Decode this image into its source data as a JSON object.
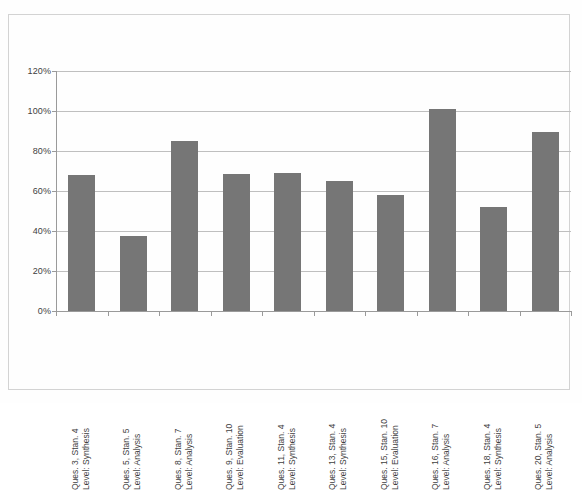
{
  "chart_data": {
    "type": "bar",
    "title": "",
    "subtitle": "",
    "xlabel": "",
    "ylabel": "",
    "ylim": [
      0,
      120
    ],
    "y_tick_labels": [
      "120%",
      "100%",
      "80%",
      "60%",
      "40%",
      "20%",
      "0%"
    ],
    "y_tick_values": [
      120,
      100,
      80,
      60,
      40,
      20,
      0
    ],
    "grid": true,
    "legend": "none",
    "bar_color": "#767676",
    "categories": [
      "Ques. 3, Stan. 4 Level: Synthesis",
      "Ques. 5, Stan. 5 Level: Analysis",
      "Ques. 8, Stan. 7 Level: Analysis",
      "Ques. 9, Stan. 10 Level: Evaluation",
      "Ques. 11, Stan. 4 Level: Synthesis",
      "Ques. 13, Stan. 4 Level: Synthesis",
      "Ques. 15, Stan. 10 Level: Evaluation",
      "Ques. 16, Stan. 7 Level: Analysis",
      "Ques. 18, Stan. 4 Level: Synthesis",
      "Ques. 20, Stan. 5 Level: Analysis"
    ],
    "category_lines": [
      {
        "line1": "Ques. 3, Stan. 4",
        "line2": "Level: Synthesis"
      },
      {
        "line1": "Ques. 5, Stan. 5",
        "line2": "Level: Analysis"
      },
      {
        "line1": "Ques. 8, Stan. 7",
        "line2": "Level: Analysis"
      },
      {
        "line1": "Ques. 9, Stan. 10",
        "line2": "Level: Evaluation"
      },
      {
        "line1": "Ques. 11, Stan. 4",
        "line2": "Level: Synthesis"
      },
      {
        "line1": "Ques. 13, Stan. 4",
        "line2": "Level: Synthesis"
      },
      {
        "line1": "Ques. 15, Stan. 10",
        "line2": "Level: Evaluation"
      },
      {
        "line1": "Ques. 16, Stan. 7",
        "line2": "Level: Analysis"
      },
      {
        "line1": "Ques. 18, Stan. 4",
        "line2": "Level: Synthesis"
      },
      {
        "line1": "Ques. 20, Stan. 5",
        "line2": "Level: Analysis"
      }
    ],
    "values": [
      68,
      37.5,
      85,
      68.5,
      69,
      65,
      58,
      101,
      52,
      89.5
    ]
  }
}
